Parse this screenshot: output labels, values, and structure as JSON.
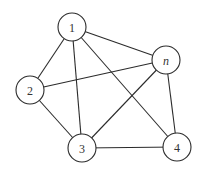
{
  "diagram": {
    "type": "undirected-graph",
    "colors": {
      "stroke": "#2b2b2b",
      "node_fill": "#ffffff",
      "label": "#333333",
      "background": "#ffffff"
    },
    "node_radius": 14,
    "nodes": [
      {
        "id": "1",
        "label": "1",
        "x": 72,
        "y": 27,
        "italic": false
      },
      {
        "id": "n",
        "label": "n",
        "x": 166,
        "y": 60,
        "italic": true
      },
      {
        "id": "2",
        "label": "2",
        "x": 30,
        "y": 90,
        "italic": false
      },
      {
        "id": "3",
        "label": "3",
        "x": 82,
        "y": 148,
        "italic": false
      },
      {
        "id": "4",
        "label": "4",
        "x": 177,
        "y": 147,
        "italic": false
      }
    ],
    "edges": [
      {
        "from": "1",
        "to": "2"
      },
      {
        "from": "1",
        "to": "3"
      },
      {
        "from": "1",
        "to": "4"
      },
      {
        "from": "1",
        "to": "n"
      },
      {
        "from": "2",
        "to": "3"
      },
      {
        "from": "2",
        "to": "n"
      },
      {
        "from": "3",
        "to": "4"
      },
      {
        "from": "3",
        "to": "n"
      },
      {
        "from": "n",
        "to": "4"
      }
    ]
  }
}
